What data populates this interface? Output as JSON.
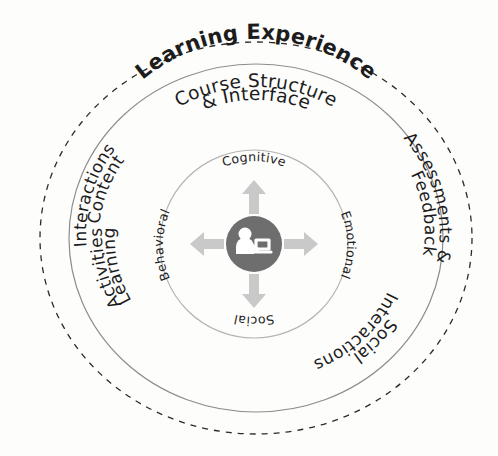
{
  "diagram": {
    "title": "Learning Experience",
    "background_color": "#fdfdfc",
    "ring_outer": {
      "name": "Learning Experience",
      "label": "Learning Experience",
      "style": "dashed",
      "stroke_color": "#2b2b2b"
    },
    "ring_middle": {
      "style": "solid",
      "stroke_color": "#8d8d8d",
      "segments": [
        {
          "id": "course-structure",
          "line1": "Course Structure",
          "line2": "& Interface",
          "position": "top"
        },
        {
          "id": "assessments-feedback",
          "line1": "Assessments &",
          "line2": "Feedback",
          "position": "right"
        },
        {
          "id": "social-interactions",
          "line1": "Social",
          "line2": "Interactions",
          "position": "bottom-right"
        },
        {
          "id": "learning-activities",
          "line1": "Learning",
          "line2": "Activities",
          "position": "bottom-left"
        },
        {
          "id": "content-interactions",
          "line1": "Content",
          "line2": "Interactions",
          "position": "left"
        }
      ]
    },
    "ring_inner": {
      "style": "solid",
      "stroke_color": "#b4b4b4",
      "dimensions": [
        {
          "id": "cognitive",
          "label": "Cognitive",
          "direction": "up"
        },
        {
          "id": "emotional",
          "label": "Emotional",
          "direction": "right"
        },
        {
          "id": "social",
          "label": "Social",
          "direction": "down"
        },
        {
          "id": "behavioral",
          "label": "Behavioral",
          "direction": "left"
        }
      ],
      "arrow_color": "#c9c9c9"
    },
    "hub": {
      "icon": "learner-at-laptop-icon",
      "fill_color": "#6e6e6e",
      "glyph_color": "#ffffff"
    }
  }
}
